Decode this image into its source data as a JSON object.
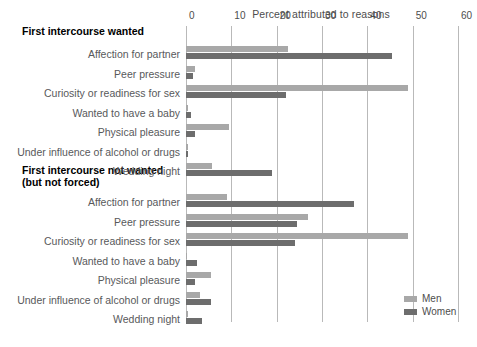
{
  "chart_data": {
    "type": "bar",
    "orientation": "horizontal",
    "title": "Percent attributed to reasons",
    "xlabel": "Percent attributed to reasons",
    "ylabel": "",
    "xlim": [
      0,
      60
    ],
    "xticks": [
      0,
      10,
      20,
      30,
      40,
      50,
      60
    ],
    "grid": "vertical",
    "legend_position": "bottom-right",
    "legend": [
      "Men",
      "Women"
    ],
    "colors": {
      "men": "#a8a8a8",
      "women": "#6d6d6d",
      "gridline": "#b9b9b9",
      "label": "#58595b",
      "heading": "#000000"
    },
    "categories": [
      "Affection for partner",
      "Peer pressure",
      "Curiosity or readiness for sex",
      "Wanted to have a baby",
      "Physical pleasure",
      "Under influence of alcohol or drugs",
      "Wedding night"
    ],
    "panels": [
      {
        "title": "First intercourse wanted",
        "series": [
          {
            "name": "Men",
            "values": [
              22.5,
              2.0,
              49.0,
              0.4,
              9.5,
              0.5,
              5.8
            ]
          },
          {
            "name": "Women",
            "values": [
              45.5,
              1.5,
              22.0,
              1.0,
              2.0,
              0.4,
              19.0
            ]
          }
        ]
      },
      {
        "title": "First intercourse not wanted\n(but not forced)",
        "series": [
          {
            "name": "Men",
            "values": [
              9.0,
              27.0,
              49.0,
              0.3,
              5.5,
              3.0,
              0.4
            ]
          },
          {
            "name": "Women",
            "values": [
              37.0,
              24.5,
              24.0,
              2.5,
              2.0,
              5.5,
              3.5
            ]
          }
        ]
      }
    ]
  },
  "axis": {
    "title": "Percent attributed to reasons",
    "ticks": [
      "0",
      "10",
      "20",
      "30",
      "40",
      "50",
      "60"
    ]
  },
  "panel_wanted": {
    "heading": "First intercourse wanted",
    "rows": [
      {
        "label": "Affection for partner",
        "men": 22.5,
        "women": 45.5
      },
      {
        "label": "Peer pressure",
        "men": 2.0,
        "women": 1.5
      },
      {
        "label": "Curiosity or readiness for sex",
        "men": 49.0,
        "women": 22.0
      },
      {
        "label": "Wanted to have a baby",
        "men": 0.4,
        "women": 1.0
      },
      {
        "label": "Physical pleasure",
        "men": 9.5,
        "women": 2.0
      },
      {
        "label": "Under influence of alcohol or drugs",
        "men": 0.5,
        "women": 0.4
      },
      {
        "label": "Wedding night",
        "men": 5.8,
        "women": 19.0
      }
    ]
  },
  "panel_notwanted": {
    "heading": "First intercourse not wanted\n(but not forced)",
    "rows": [
      {
        "label": "Affection for partner",
        "men": 9.0,
        "women": 37.0
      },
      {
        "label": "Peer pressure",
        "men": 27.0,
        "women": 24.5
      },
      {
        "label": "Curiosity or readiness for sex",
        "men": 49.0,
        "women": 24.0
      },
      {
        "label": "Wanted to have a baby",
        "men": 0.3,
        "women": 2.5
      },
      {
        "label": "Physical pleasure",
        "men": 5.5,
        "women": 2.0
      },
      {
        "label": "Under influence of alcohol or drugs",
        "men": 3.0,
        "women": 5.5
      },
      {
        "label": "Wedding night",
        "men": 0.4,
        "women": 3.5
      }
    ]
  },
  "legend": {
    "men_label": "Men",
    "women_label": "Women"
  }
}
